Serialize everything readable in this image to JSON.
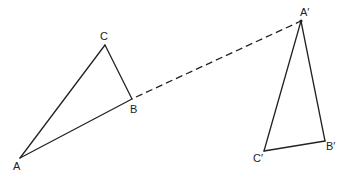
{
  "diagram": {
    "type": "geometric-transformation",
    "triangles": [
      {
        "name": "ABC",
        "vertices": [
          {
            "label": "A",
            "x": 20,
            "y": 158,
            "lx": 13,
            "ly": 170
          },
          {
            "label": "B",
            "x": 132,
            "y": 99,
            "lx": 130,
            "ly": 113
          },
          {
            "label": "C",
            "x": 105,
            "y": 45,
            "lx": 100,
            "ly": 40
          }
        ]
      },
      {
        "name": "A'B'C'",
        "vertices": [
          {
            "label": "A′",
            "x": 301,
            "y": 21,
            "lx": 300,
            "ly": 16
          },
          {
            "label": "B′",
            "x": 325,
            "y": 141,
            "lx": 326,
            "ly": 150
          },
          {
            "label": "C′",
            "x": 264,
            "y": 151,
            "lx": 253,
            "ly": 162
          }
        ]
      }
    ],
    "connector": {
      "style": "dashed",
      "from": "B",
      "to": "A′",
      "x1": 132,
      "y1": 99,
      "x2": 301,
      "y2": 21
    }
  },
  "labels": {
    "A": "A",
    "B": "B",
    "C": "C",
    "A_prime": "A′",
    "B_prime": "B′",
    "C_prime": "C′"
  },
  "colors": {
    "line": "#222222",
    "background": "#ffffff"
  }
}
